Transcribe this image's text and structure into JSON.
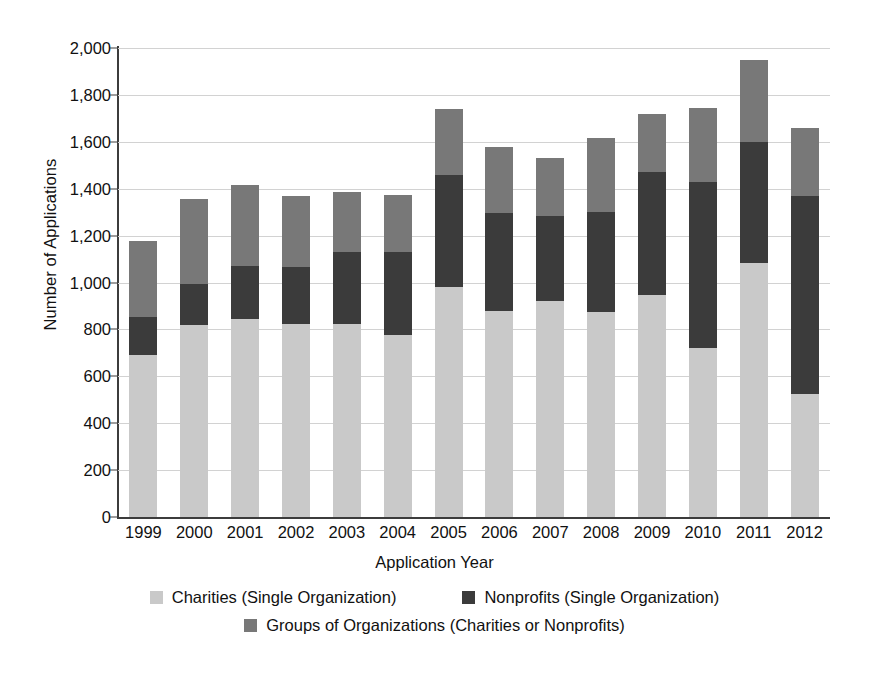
{
  "chart_data": {
    "type": "bar",
    "subtype": "stacked-vertical",
    "title": "",
    "xlabel": "Application Year",
    "ylabel": "Number of Applications",
    "categories": [
      "1999",
      "2000",
      "2001",
      "2002",
      "2003",
      "2004",
      "2005",
      "2006",
      "2007",
      "2008",
      "2009",
      "2010",
      "2011",
      "2012"
    ],
    "ylim": [
      0,
      2000
    ],
    "ytick_values": [
      0,
      200,
      400,
      600,
      800,
      1000,
      1200,
      1400,
      1600,
      1800,
      2000
    ],
    "ytick_labels": [
      "0",
      "200",
      "400",
      "600",
      "800",
      "1,000",
      "1,200",
      "1,400",
      "1,600",
      "1,800",
      "2,000"
    ],
    "grid": true,
    "legend_position": "bottom",
    "series": [
      {
        "name": "Charities (Single Organization)",
        "color": "#c9c9c9",
        "values": [
          690,
          820,
          845,
          825,
          822,
          775,
          980,
          880,
          920,
          875,
          945,
          720,
          1085,
          525
        ]
      },
      {
        "name": "Nonprofits (Single Organization)",
        "color": "#3b3b3b",
        "values": [
          165,
          175,
          225,
          240,
          308,
          355,
          480,
          415,
          365,
          425,
          525,
          710,
          515,
          845
        ]
      },
      {
        "name": "Groups of Organizations (Charities or Nonprofits)",
        "color": "#787878",
        "values": [
          320,
          360,
          345,
          305,
          255,
          245,
          280,
          285,
          245,
          315,
          250,
          315,
          350,
          290
        ]
      }
    ],
    "totals": [
      1175,
      1355,
      1415,
      1370,
      1385,
      1375,
      1740,
      1580,
      1530,
      1615,
      1720,
      1745,
      1950,
      1660
    ]
  },
  "legend": {
    "items": [
      {
        "label": "Charities (Single Organization)",
        "color": "#c9c9c9",
        "swatch": "legend-swatch-charities"
      },
      {
        "label": "Nonprofits (Single Organization)",
        "color": "#3b3b3b",
        "swatch": "legend-swatch-nonprofits"
      },
      {
        "label": "Groups of Organizations (Charities or Nonprofits)",
        "color": "#787878",
        "swatch": "legend-swatch-groups"
      }
    ]
  },
  "axes": {
    "y_title": "Number of Applications",
    "x_title": "Application Year"
  },
  "colors": {
    "background": "#ffffff",
    "axis": "#3c3c3c",
    "gridline": "#d2d2d2",
    "text": "#111111"
  }
}
